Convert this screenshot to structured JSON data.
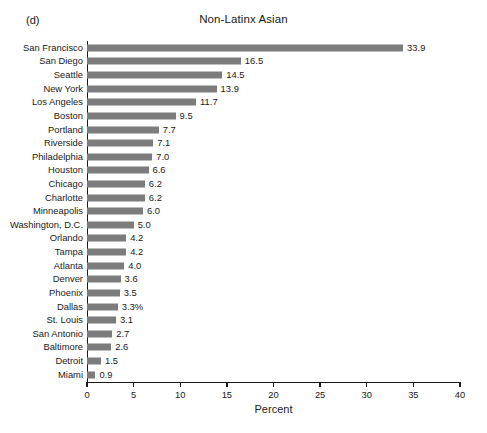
{
  "figure": {
    "panel_label": "(d)",
    "title": "Non-Latinx Asian"
  },
  "axis": {
    "x_title": "Percent",
    "x_ticks": [
      "0",
      "5",
      "10",
      "15",
      "20",
      "25",
      "30",
      "35",
      "40"
    ]
  },
  "colors": {
    "bar": "#7c7c7c",
    "axis": "#1a1a1a",
    "background": "#ffffff"
  },
  "chart_data": {
    "type": "bar",
    "orientation": "horizontal",
    "title": "Non-Latinx Asian",
    "panel": "(d)",
    "xlabel": "Percent",
    "ylabel": "",
    "xlim": [
      0,
      40
    ],
    "xticks": [
      0,
      5,
      10,
      15,
      20,
      25,
      30,
      35,
      40
    ],
    "grid": false,
    "legend": false,
    "categories": [
      "San Francisco",
      "San Diego",
      "Seattle",
      "New York",
      "Los Angeles",
      "Boston",
      "Portland",
      "Riverside",
      "Philadelphia",
      "Houston",
      "Chicago",
      "Charlotte",
      "Minneapolis",
      "Washington, D.C.",
      "Orlando",
      "Tampa",
      "Atlanta",
      "Denver",
      "Phoenix",
      "Dallas",
      "St. Louis",
      "San Antonio",
      "Baltimore",
      "Detroit",
      "Miami"
    ],
    "values": [
      33.9,
      16.5,
      14.5,
      13.9,
      11.7,
      9.5,
      7.7,
      7.1,
      7.0,
      6.6,
      6.2,
      6.2,
      6.0,
      5.0,
      4.2,
      4.2,
      4.0,
      3.6,
      3.5,
      3.3,
      3.1,
      2.7,
      2.6,
      1.5,
      0.9
    ],
    "data_labels": [
      "33.9",
      "16.5",
      "14.5",
      "13.9",
      "11.7",
      "9.5",
      "7.7",
      "7.1",
      "7.0",
      "6.6",
      "6.2",
      "6.2",
      "6.0",
      "5.0",
      "4.2",
      "4.2",
      "4.0",
      "3.6",
      "3.5",
      "3.3%",
      "3.1",
      "2.7",
      "2.6",
      "1.5",
      "0.9"
    ]
  }
}
